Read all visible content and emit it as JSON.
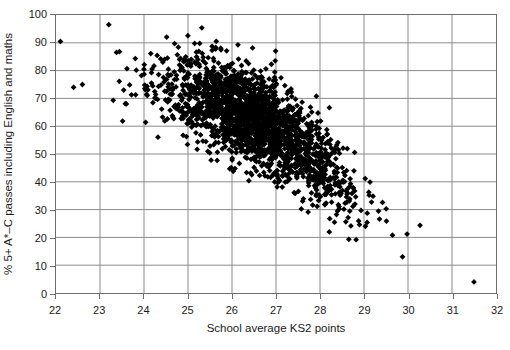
{
  "chart_data": {
    "type": "scatter",
    "title": "",
    "xlabel": "School average KS2 points",
    "ylabel": "% 5+ A*–C passes including English and maths",
    "xlim": [
      22,
      32
    ],
    "ylim": [
      0,
      100
    ],
    "xticks": [
      22,
      23,
      24,
      25,
      26,
      27,
      28,
      29,
      30,
      31,
      32
    ],
    "yticks": [
      0,
      10,
      20,
      30,
      40,
      50,
      60,
      70,
      80,
      90,
      100
    ],
    "xtick_labels": [
      "22",
      "23",
      "24",
      "25",
      "26",
      "27",
      "28",
      "29",
      "30",
      "31",
      "32"
    ],
    "ytick_labels": [
      "0",
      "10",
      "20",
      "30",
      "40",
      "50",
      "60",
      "70",
      "80",
      "90",
      "100"
    ],
    "grid": true,
    "grid_color": "#8a8a8a",
    "legend": null,
    "marker": "diamond",
    "marker_color": "#000000",
    "marker_size": 4,
    "point_count": 2100,
    "correlation": -0.72,
    "trend": "negative",
    "annotations": [],
    "outliers": [
      [
        22.1,
        90.5
      ],
      [
        22.4,
        74.0
      ],
      [
        22.6,
        75.0
      ],
      [
        23.2,
        96.5
      ],
      [
        23.3,
        69.3
      ],
      [
        23.6,
        68.0
      ],
      [
        31.5,
        4.0
      ]
    ],
    "series": [
      {
        "name": "Schools",
        "x_range": [
          22.1,
          31.6
        ],
        "y_range": [
          3.5,
          96.5
        ],
        "band": {
          "x": [
            23.0,
            24.0,
            25.0,
            26.0,
            27.0,
            28.0,
            29.0,
            30.0,
            31.0
          ],
          "y_mean": [
            78,
            76,
            72,
            67,
            59,
            47,
            33,
            22,
            13
          ],
          "y_spread": [
            12,
            14,
            15,
            16,
            16,
            15,
            12,
            8,
            6
          ]
        }
      }
    ]
  }
}
